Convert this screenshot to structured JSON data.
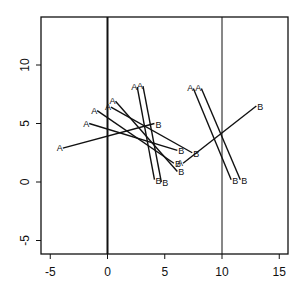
{
  "chart_data": {
    "type": "scatter",
    "title": "",
    "xlabel": "",
    "ylabel": "",
    "xlim": [
      -6,
      15.6
    ],
    "ylim": [
      -6.1,
      14.2
    ],
    "x_ticks": [
      -5,
      0,
      5,
      10,
      15
    ],
    "y_ticks": [
      -5,
      0,
      5,
      10
    ],
    "grid": false,
    "vertical_lines": [
      {
        "x": 0,
        "width": 2
      },
      {
        "x": 10,
        "width": 1
      }
    ],
    "segments": [
      {
        "a": [
          -3.9,
          2.9
        ],
        "b": [
          4.1,
          5.0
        ],
        "label_a": "A",
        "label_b": "B"
      },
      {
        "a": [
          -1.6,
          5.0
        ],
        "b": [
          6.1,
          2.7
        ],
        "label_a": "A",
        "label_b": "B"
      },
      {
        "a": [
          -0.9,
          6.1
        ],
        "b": [
          5.8,
          1.6
        ],
        "label_a": "A",
        "label_b": "B"
      },
      {
        "a": [
          0.3,
          6.4
        ],
        "b": [
          7.4,
          2.5
        ],
        "label_a": "A",
        "label_b": "B"
      },
      {
        "a": [
          0.7,
          6.9
        ],
        "b": [
          6.1,
          0.9
        ],
        "label_a": "A",
        "label_b": "B"
      },
      {
        "a": [
          2.6,
          8.1
        ],
        "b": [
          4.1,
          0.2
        ],
        "label_a": "A",
        "label_b": "B"
      },
      {
        "a": [
          3.1,
          8.2
        ],
        "b": [
          4.7,
          0.0
        ],
        "label_a": "A",
        "label_b": "B"
      },
      {
        "a": [
          6.6,
          1.6
        ],
        "b": [
          13.0,
          6.5
        ],
        "label_a": "A",
        "label_b": "B"
      },
      {
        "a": [
          7.5,
          8.0
        ],
        "b": [
          10.8,
          0.2
        ],
        "label_a": "A",
        "label_b": "B"
      },
      {
        "a": [
          8.2,
          8.0
        ],
        "b": [
          11.6,
          0.2
        ],
        "label_a": "A",
        "label_b": "B"
      }
    ],
    "colors": {
      "line": "#111111",
      "frame": "#111111"
    }
  }
}
